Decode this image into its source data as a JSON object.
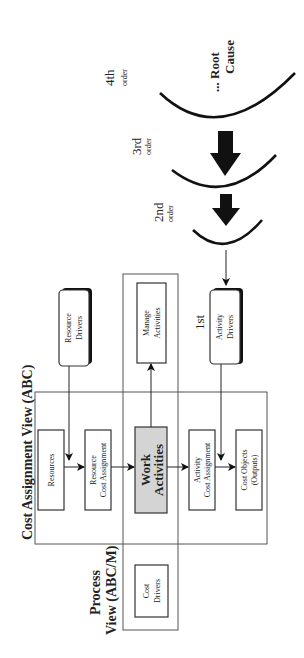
{
  "diagram": {
    "frames": {
      "cost_assignment_view": "Cost Assignment View (ABC)",
      "process_view_line1": "Process",
      "process_view_line2": "View (ABC/M)"
    },
    "boxes": {
      "resources": [
        "Resources"
      ],
      "resource_cost_assignment": [
        "Resource",
        "Cost Assignment"
      ],
      "work_activities": [
        "Work",
        "Activities"
      ],
      "activity_cost_assignment": [
        "Activity",
        "Cost Assignment"
      ],
      "cost_objects": [
        "Cost Objects",
        "(Outputs)"
      ],
      "cost_drivers": [
        "Cost",
        "Drivers"
      ],
      "manage_activities": [
        "Manage",
        "Activities"
      ],
      "resource_drivers": [
        "Resource",
        "Drivers"
      ],
      "activity_drivers": [
        "Activity",
        "Drivers"
      ]
    },
    "orders": {
      "first": "1st",
      "second": [
        "2nd",
        "order"
      ],
      "third": [
        "3rd",
        "order"
      ],
      "fourth": [
        "4th",
        "order"
      ],
      "root_cause": [
        "... Root",
        "Cause"
      ]
    },
    "colors": {
      "work_activities_fill": "#d4d4d4",
      "stroke": "#333333",
      "arrow": "#111111"
    }
  }
}
